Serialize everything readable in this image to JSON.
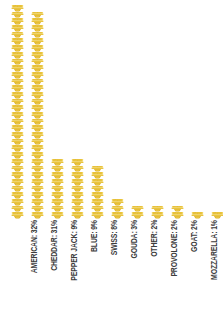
{
  "chart": {
    "title": "",
    "icon_name": "cheese-wheel-icon",
    "accent_color": "#E9C43F",
    "accent_color_dark": "#D9AE26",
    "accent_color_light": "#F4DB72",
    "background_color": "#FFFFFF",
    "label_color": "#3C3C3C",
    "unit_note": "1 icon = 1 percent"
  },
  "chart_data": {
    "type": "bar",
    "variant": "pictogram",
    "title": "",
    "subtitle": "",
    "xlabel": "",
    "ylabel": "",
    "unit": "%",
    "icon_unit_value": 1,
    "grid": false,
    "legend": false,
    "ylim": [
      0,
      32
    ],
    "categories": [
      "AMERICAN",
      "CHEDDAR",
      "PEPPER JACK",
      "BLUE",
      "SWISS",
      "GOUDA",
      "OTHER",
      "PROVOLONE",
      "GOAT",
      "MOZZARELLA",
      "MONTEREY JACK"
    ],
    "values": [
      32,
      31,
      9,
      9,
      8,
      3,
      2,
      2,
      2,
      1,
      1
    ],
    "tick_labels": [
      "AMERICAN: 32%",
      "CHEDDAR: 31%",
      "PEPPER JACK: 9%",
      "BLUE: 9%",
      "SWISS: 8%",
      "GOUDA: 3%",
      "OTHER: 2%",
      "PROVOLONE: 2%",
      "GOAT: 2%",
      "MOZZARELLA: 1%",
      "MONTEREY JACK: 1%"
    ],
    "value_labels": [
      "32%",
      "31%",
      "9%",
      "9%",
      "8%",
      "3%",
      "2%",
      "2%",
      "2%",
      "1%",
      "1%"
    ]
  }
}
